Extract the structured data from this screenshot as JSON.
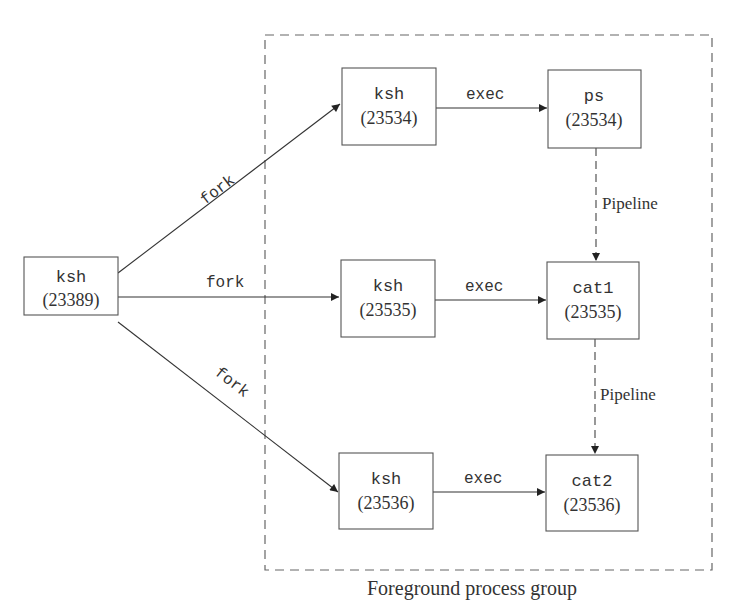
{
  "diagram": {
    "group_label": "Foreground process group",
    "colors": {
      "line": "#3a3a3a",
      "box_border": "#555555",
      "dash": "#666666",
      "text": "#333333",
      "background": "#ffffff"
    },
    "nodes": [
      {
        "id": "parent",
        "name": "ksh",
        "pid": "(23389)",
        "x": 24,
        "y": 257,
        "w": 94,
        "h": 58
      },
      {
        "id": "ksh1",
        "name": "ksh",
        "pid": "(23534)",
        "x": 342,
        "y": 68,
        "w": 94,
        "h": 77
      },
      {
        "id": "ps",
        "name": "ps",
        "pid": "(23534)",
        "x": 548,
        "y": 70,
        "w": 93,
        "h": 78
      },
      {
        "id": "ksh2",
        "name": "ksh",
        "pid": "(23535)",
        "x": 341,
        "y": 260,
        "w": 94,
        "h": 77
      },
      {
        "id": "cat1",
        "name": "cat1",
        "pid": "(23535)",
        "x": 547,
        "y": 262,
        "w": 92,
        "h": 77
      },
      {
        "id": "ksh3",
        "name": "ksh",
        "pid": "(23536)",
        "x": 339,
        "y": 453,
        "w": 94,
        "h": 76
      },
      {
        "id": "cat2",
        "name": "cat2",
        "pid": "(23536)",
        "x": 546,
        "y": 455,
        "w": 92,
        "h": 76
      }
    ],
    "edges": [
      {
        "from": "parent",
        "to": "ksh1",
        "label": "fork",
        "style": "solid"
      },
      {
        "from": "parent",
        "to": "ksh2",
        "label": "fork",
        "style": "solid"
      },
      {
        "from": "parent",
        "to": "ksh3",
        "label": "fork",
        "style": "solid"
      },
      {
        "from": "ksh1",
        "to": "ps",
        "label": "exec",
        "style": "solid"
      },
      {
        "from": "ksh2",
        "to": "cat1",
        "label": "exec",
        "style": "solid"
      },
      {
        "from": "ksh3",
        "to": "cat2",
        "label": "exec",
        "style": "solid"
      },
      {
        "from": "ps",
        "to": "cat1",
        "label": "Pipeline",
        "style": "dashed"
      },
      {
        "from": "cat1",
        "to": "cat2",
        "label": "Pipeline",
        "style": "dashed"
      }
    ]
  }
}
